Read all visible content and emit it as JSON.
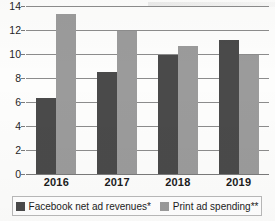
{
  "chart_data": {
    "type": "bar",
    "title": "",
    "xlabel": "",
    "ylabel": "",
    "categories": [
      "2016",
      "2017",
      "2018",
      "2019"
    ],
    "series": [
      {
        "name": "Facebook net ad revenues*",
        "color": "#4a4a4a",
        "values": [
          6.3,
          8.5,
          9.9,
          11.2
        ]
      },
      {
        "name": "Print ad spending**",
        "color": "#9b9b9b",
        "values": [
          13.3,
          11.9,
          10.7,
          9.9
        ]
      }
    ],
    "ylim": [
      0,
      14
    ],
    "yticks": [
      0,
      2,
      4,
      6,
      8,
      10,
      12,
      14
    ],
    "ytick_labels": [
      "0",
      "2",
      "4",
      "6",
      "8",
      "10",
      "12",
      "14"
    ],
    "grid": true,
    "legend_position": "bottom"
  },
  "legend": {
    "items": [
      {
        "label": "Facebook net ad revenues*"
      },
      {
        "label": "Print ad spending**"
      }
    ]
  }
}
